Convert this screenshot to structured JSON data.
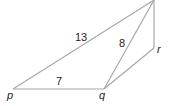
{
  "diagram": {
    "type": "geometry",
    "points": {
      "p": {
        "label": "p",
        "x": 13,
        "y": 89
      },
      "q": {
        "label": "q",
        "x": 104,
        "y": 89
      },
      "r": {
        "label": "r",
        "x": 154,
        "y": 48
      },
      "top": {
        "label": "",
        "x": 154,
        "y": 0
      }
    },
    "segments": [
      {
        "from": "p",
        "to": "top",
        "length_label": "13"
      },
      {
        "from": "p",
        "to": "q",
        "length_label": "7"
      },
      {
        "from": "q",
        "to": "top",
        "length_label": "8"
      },
      {
        "from": "q",
        "to": "r",
        "length_label": ""
      },
      {
        "from": "r",
        "to": "top",
        "length_label": ""
      }
    ],
    "labels": {
      "p": "p",
      "q": "q",
      "r": "r",
      "len_pt": "13",
      "len_pq": "7",
      "len_qt": "8"
    }
  }
}
